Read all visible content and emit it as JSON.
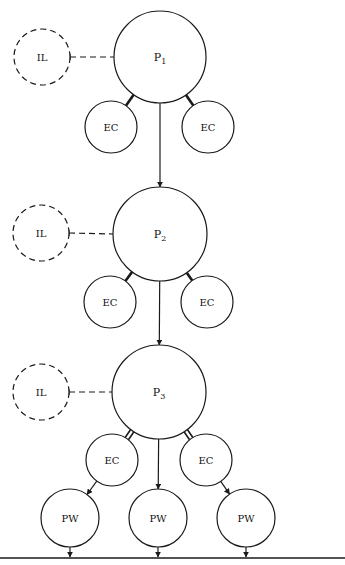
{
  "diagram": {
    "stroke_color": "#1a1a1a",
    "background": "#ffffff",
    "levels": [
      {
        "primary": {
          "label": "P",
          "subscript": "1",
          "cx": 160,
          "cy": 57,
          "r": 46
        },
        "influence": {
          "label": "IL",
          "cx": 42,
          "cy": 57,
          "r": 28
        },
        "children": [
          {
            "label": "EC",
            "cx": 111,
            "cy": 127,
            "r": 26
          },
          {
            "label": "EC",
            "cx": 208,
            "cy": 127,
            "r": 26
          }
        ]
      },
      {
        "primary": {
          "label": "P",
          "subscript": "2",
          "cx": 160,
          "cy": 234,
          "r": 47
        },
        "influence": {
          "label": "IL",
          "cx": 41,
          "cy": 233,
          "r": 28
        },
        "children": [
          {
            "label": "EC",
            "cx": 110,
            "cy": 302,
            "r": 26
          },
          {
            "label": "EC",
            "cx": 207,
            "cy": 302,
            "r": 26
          }
        ]
      },
      {
        "primary": {
          "label": "P",
          "subscript": "3",
          "cx": 159,
          "cy": 392,
          "r": 47
        },
        "influence": {
          "label": "IL",
          "cx": 41,
          "cy": 392,
          "r": 28
        },
        "children": [
          {
            "label": "EC",
            "cx": 112,
            "cy": 460,
            "r": 26
          },
          {
            "label": "EC",
            "cx": 206,
            "cy": 460,
            "r": 26
          }
        ]
      }
    ],
    "outputs": [
      {
        "label": "PW",
        "cx": 70,
        "cy": 518,
        "r": 29
      },
      {
        "label": "PW",
        "cx": 158,
        "cy": 518,
        "r": 29
      },
      {
        "label": "PW",
        "cx": 246,
        "cy": 518,
        "r": 29
      }
    ],
    "ground_line": {
      "x1": 0,
      "x2": 345,
      "y": 558
    }
  }
}
